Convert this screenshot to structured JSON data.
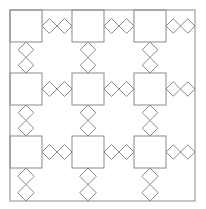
{
  "diagram": {
    "title": "",
    "stroke_color": "#8a8a8a",
    "background": "#ffffff",
    "outer_border": {
      "x": 10,
      "y": 10,
      "w": 185,
      "h": 191
    },
    "square_size": 32,
    "columns": [
      10,
      72,
      134
    ],
    "rows": [
      10,
      73,
      136
    ],
    "diamond_half": 7.5,
    "pattern": "3x3 grid of squares joined by pairs of diamonds"
  }
}
